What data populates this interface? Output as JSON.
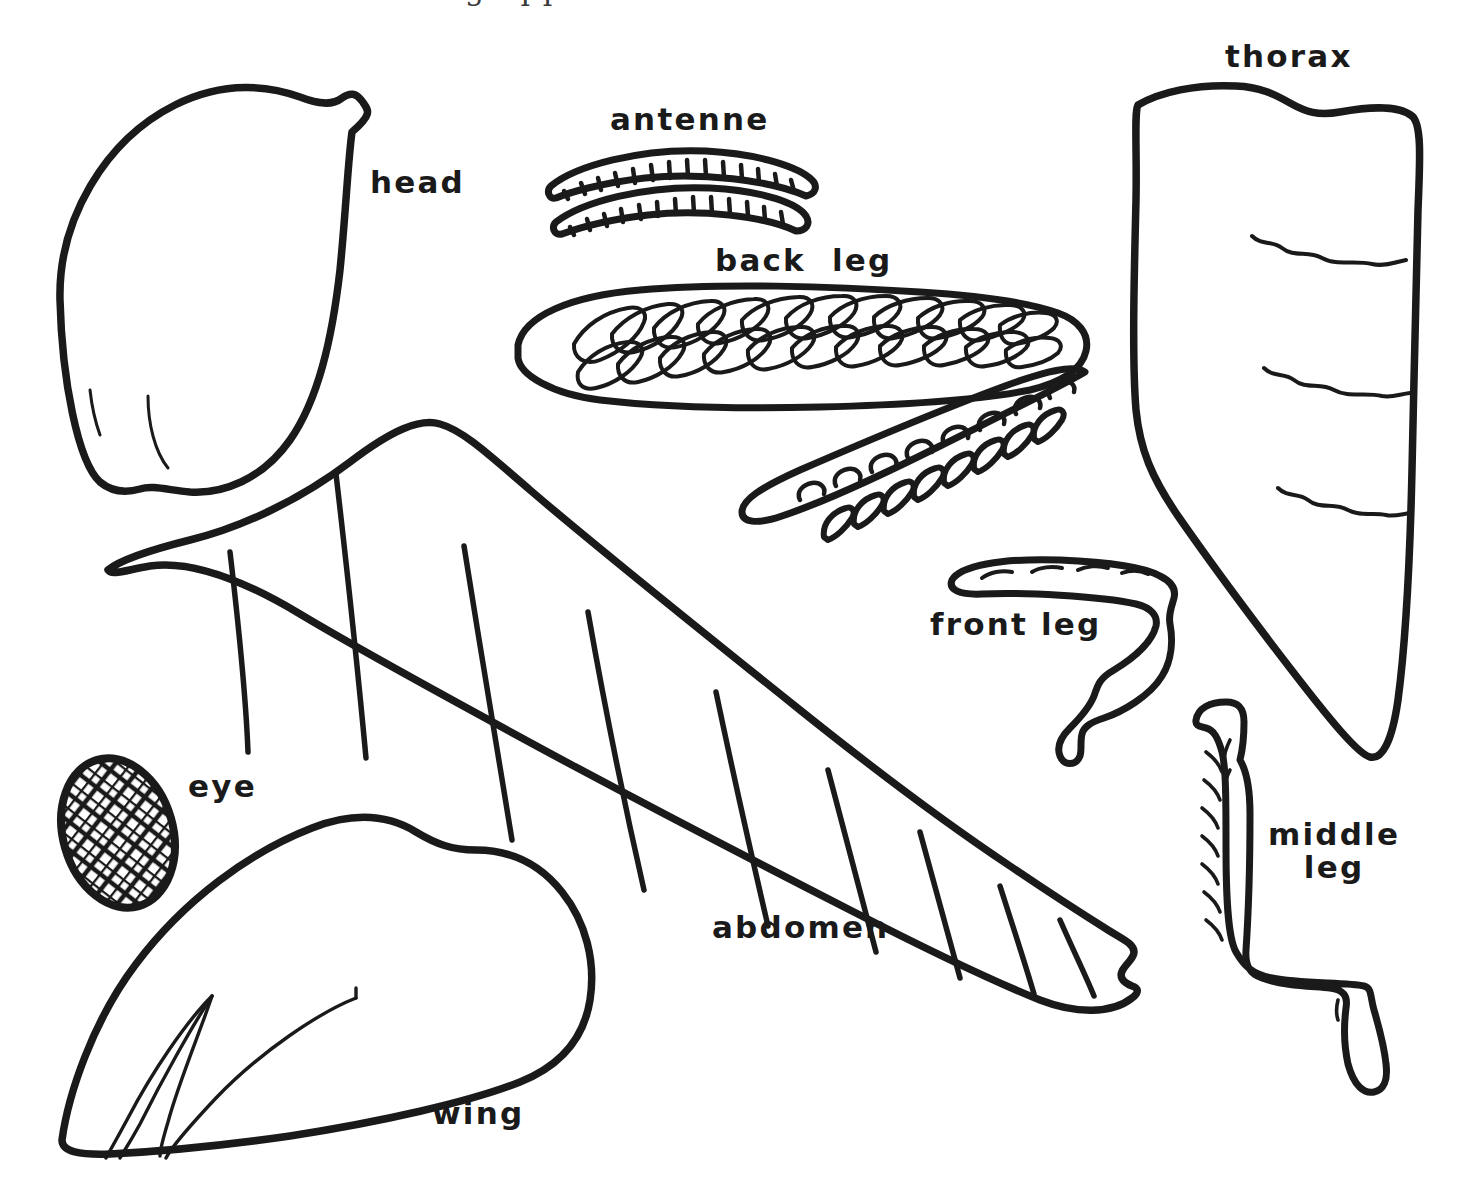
{
  "document": {
    "kind": "hand-drawn insect anatomy worksheet",
    "background_color": "#ffffff",
    "ink_color": "#1a1a1a",
    "partial_top_text": "ing app"
  },
  "labels": [
    {
      "key": "thorax",
      "text": "thorax",
      "x": 1225,
      "y": 40
    },
    {
      "key": "antenne",
      "text": "antenne",
      "x": 610,
      "y": 103
    },
    {
      "key": "head",
      "text": "head",
      "x": 370,
      "y": 166
    },
    {
      "key": "back_leg",
      "text": "back  leg",
      "x": 715,
      "y": 244
    },
    {
      "key": "front_leg",
      "text": "front leg",
      "x": 930,
      "y": 608
    },
    {
      "key": "eye",
      "text": "eye",
      "x": 188,
      "y": 770
    },
    {
      "key": "middle_leg",
      "text": "middle\nleg",
      "x": 1268,
      "y": 818
    },
    {
      "key": "abdomen",
      "text": "abdomen",
      "x": 712,
      "y": 911
    },
    {
      "key": "wing",
      "text": "wing",
      "x": 432,
      "y": 1097
    }
  ],
  "parts": [
    {
      "key": "head",
      "name": "head-shape"
    },
    {
      "key": "antenne",
      "name": "antenne-shape"
    },
    {
      "key": "back_leg",
      "name": "back-leg-shape"
    },
    {
      "key": "thorax",
      "name": "thorax-shape"
    },
    {
      "key": "abdomen",
      "name": "abdomen-shape"
    },
    {
      "key": "front_leg",
      "name": "front-leg-shape"
    },
    {
      "key": "middle_leg",
      "name": "middle-leg-shape"
    },
    {
      "key": "eye",
      "name": "eye-shape"
    },
    {
      "key": "wing",
      "name": "wing-shape"
    }
  ]
}
